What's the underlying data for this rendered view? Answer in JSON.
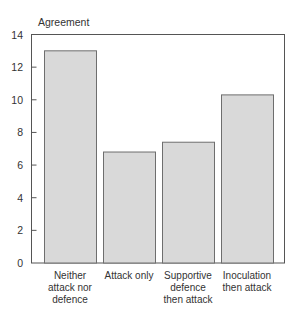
{
  "chart_data": {
    "type": "bar",
    "title": "",
    "xlabel": "",
    "ylabel": "Agreement",
    "ylim": [
      0,
      14
    ],
    "yticks": [
      0,
      2,
      4,
      6,
      8,
      10,
      12,
      14
    ],
    "grid": false,
    "legend": null,
    "categories": [
      "Neither attack nor defence",
      "Attack only",
      "Supportive defence then attack",
      "Inoculation then attack"
    ],
    "category_lines": [
      [
        "Neither",
        "attack nor",
        "defence"
      ],
      [
        "Attack only"
      ],
      [
        "Supportive",
        "defence",
        "then attack"
      ],
      [
        "Inoculation",
        "then attack"
      ]
    ],
    "values": [
      13.0,
      6.8,
      7.4,
      10.3
    ],
    "colors": {
      "bar_fill": "#d9d9d9",
      "bar_stroke": "#6e6e6e",
      "axis": "#555555",
      "text": "#333333"
    }
  }
}
